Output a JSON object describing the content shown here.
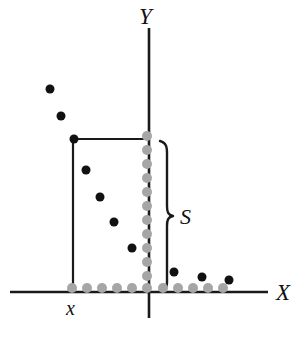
{
  "figure": {
    "title": "",
    "background": "#ffffff",
    "width": 298,
    "height": 348
  },
  "labels": {
    "y_axis": "Y",
    "x_axis": "X",
    "threshold_point": "x",
    "region_label": "S"
  },
  "colors": {
    "axis": "#1a1a1a",
    "black_point": "#111111",
    "gray_point": "#a6a6a6",
    "rect_outline": "#1a1a1a",
    "brace": "#1a1a1a"
  },
  "chart_data": {
    "type": "scatter",
    "title": "",
    "xlabel": "X",
    "ylabel": "Y",
    "grid": false,
    "legend": null,
    "axes": {
      "x_axis_y_px": 292,
      "x_axis_x_start_px": 10,
      "x_axis_x_end_px": 268,
      "y_axis_x_px": 149,
      "y_axis_y_start_px": 28,
      "y_axis_y_end_px": 318
    },
    "series": [
      {
        "name": "black-points-outside-left",
        "color": "#111111",
        "marker": "filled-circle",
        "radius_px": 4.5,
        "points": [
          {
            "x": 50,
            "y": 89
          },
          {
            "x": 61,
            "y": 116
          }
        ]
      },
      {
        "name": "black-points-inside-rect",
        "color": "#111111",
        "marker": "filled-circle",
        "radius_px": 4.5,
        "points": [
          {
            "x": 74,
            "y": 139
          },
          {
            "x": 86,
            "y": 170
          },
          {
            "x": 100,
            "y": 197
          },
          {
            "x": 114,
            "y": 222
          },
          {
            "x": 132,
            "y": 248
          }
        ]
      },
      {
        "name": "black-points-right-of-axis",
        "color": "#111111",
        "marker": "filled-circle",
        "radius_px": 4.5,
        "points": [
          {
            "x": 174,
            "y": 272
          },
          {
            "x": 202,
            "y": 277
          },
          {
            "x": 229,
            "y": 280
          }
        ]
      },
      {
        "name": "gray-points-x-axis",
        "color": "#a6a6a6",
        "marker": "filled-circle",
        "radius_px": 5,
        "points": [
          {
            "x": 72,
            "y": 288
          },
          {
            "x": 87,
            "y": 288
          },
          {
            "x": 102,
            "y": 288
          },
          {
            "x": 117,
            "y": 288
          },
          {
            "x": 132,
            "y": 288
          },
          {
            "x": 147,
            "y": 288
          },
          {
            "x": 163,
            "y": 288
          },
          {
            "x": 178,
            "y": 288
          },
          {
            "x": 193,
            "y": 288
          },
          {
            "x": 208,
            "y": 288
          },
          {
            "x": 223,
            "y": 288
          }
        ]
      },
      {
        "name": "gray-points-y-column",
        "color": "#a6a6a6",
        "marker": "filled-circle",
        "radius_px": 5,
        "points": [
          {
            "x": 147,
            "y": 136
          },
          {
            "x": 147,
            "y": 150
          },
          {
            "x": 147,
            "y": 164
          },
          {
            "x": 147,
            "y": 178
          },
          {
            "x": 147,
            "y": 192
          },
          {
            "x": 147,
            "y": 206
          },
          {
            "x": 147,
            "y": 220
          },
          {
            "x": 147,
            "y": 234
          },
          {
            "x": 147,
            "y": 248
          },
          {
            "x": 147,
            "y": 262
          },
          {
            "x": 147,
            "y": 276
          }
        ]
      }
    ],
    "annotations": [
      {
        "name": "rectangle-region",
        "type": "rect-open",
        "left_px": 73,
        "top_px": 139,
        "right_px": 148,
        "bottom_px": 292
      },
      {
        "name": "brace-S",
        "type": "curly-brace",
        "x_px": 163,
        "top_px": 140,
        "bottom_px": 291,
        "tip_x_px": 172,
        "tip_y_px": 216,
        "label": "S"
      },
      {
        "name": "x-tick-label",
        "type": "text",
        "x_px": 73,
        "y_px": 310,
        "text": "x"
      }
    ]
  }
}
